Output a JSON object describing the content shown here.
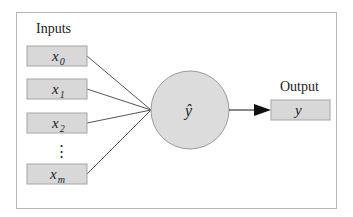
{
  "diagram": {
    "type": "perceptron",
    "colors": {
      "frame": "#b8b8b8",
      "box_fill": "#d8d8d8",
      "box_stroke": "#a6a6a6",
      "node_fill": "#dcdcdc",
      "node_stroke": "#9a9a9a",
      "edge": "#555555",
      "arrow": "#111111",
      "text": "#222222"
    },
    "inputs_label": "Inputs",
    "output_label": "Output",
    "inputs": [
      {
        "symbol": "x",
        "subscript": "0"
      },
      {
        "symbol": "x",
        "subscript": "1"
      },
      {
        "symbol": "x",
        "subscript": "2"
      },
      {
        "symbol": "x",
        "subscript": "m"
      }
    ],
    "ellipsis": "⋮",
    "node": {
      "symbol": "ŷ"
    },
    "output": {
      "symbol": "y"
    }
  }
}
